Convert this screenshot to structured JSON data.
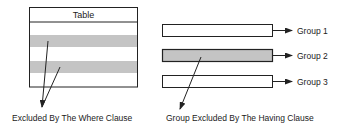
{
  "colors": {
    "stroke": "#222222",
    "excluded_fill": "#c4c4c4",
    "background": "#ffffff"
  },
  "table": {
    "title": "Table",
    "rows": [
      {
        "excluded": false
      },
      {
        "excluded": true
      },
      {
        "excluded": false
      },
      {
        "excluded": true
      },
      {
        "excluded": false
      }
    ]
  },
  "groups": [
    {
      "label": "Group 1",
      "excluded": false
    },
    {
      "label": "Group 2",
      "excluded": true
    },
    {
      "label": "Group 3",
      "excluded": false
    }
  ],
  "annotations": {
    "where": "Excluded By The Where Clause",
    "having": "Group Excluded By The Having Clause"
  }
}
